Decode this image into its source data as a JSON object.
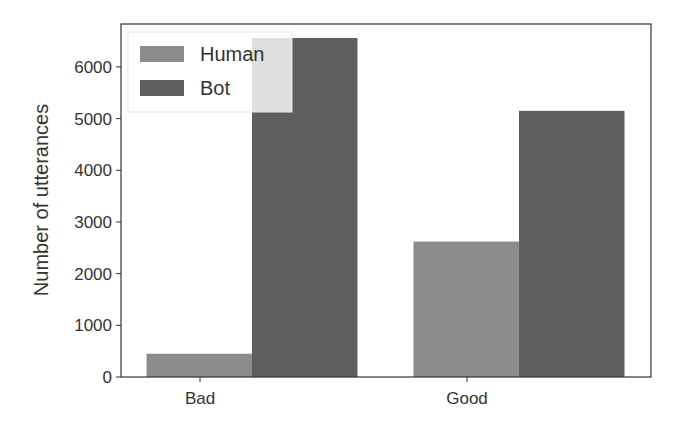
{
  "chart_data": {
    "type": "bar",
    "title": "",
    "xlabel": "",
    "ylabel": "Number of utterances",
    "categories": [
      "Bad",
      "Good"
    ],
    "series": [
      {
        "name": "Human",
        "values": [
          450,
          2620
        ],
        "color": "#8c8c8c"
      },
      {
        "name": "Bot",
        "values": [
          6560,
          5150
        ],
        "color": "#5e5e5e"
      }
    ],
    "yticks": [
      0,
      1000,
      2000,
      3000,
      4000,
      5000,
      6000
    ],
    "ylim": [
      0,
      6830
    ],
    "grid": false,
    "legend_position": "upper left"
  }
}
